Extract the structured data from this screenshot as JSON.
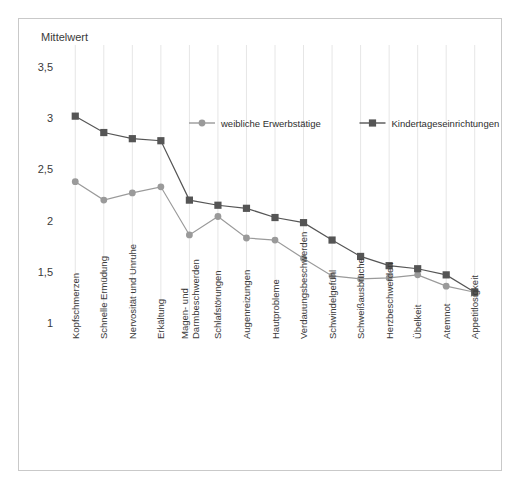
{
  "chart_data": {
    "type": "line",
    "title": "Mittelwert",
    "ylabel": "Mittelwert",
    "xlabel": "",
    "ylim": [
      1,
      3.5
    ],
    "yticks": [
      1,
      1.5,
      2,
      2.5,
      3,
      3.5
    ],
    "ytick_labels": [
      "1",
      "1,5",
      "2",
      "2,5",
      "3",
      "3,5"
    ],
    "grid": "vertical",
    "legend_position": "top-center",
    "categories": [
      "Kopfschmerzen",
      "Schnelle Ermüdung",
      "Nervosität und Unruhe",
      "Erkältung",
      "Magen- und Darmbeschwerden",
      "Schlafstörungen",
      "Augenreizungen",
      "Hautprobleme",
      "Verdauungsbeschwerden",
      "Schwindelgefühl",
      "Schweißausbrüche",
      "Herzbeschwerden",
      "Übelkeit",
      "Atemnot",
      "Appetitlosigkeit"
    ],
    "series": [
      {
        "name": "weibliche Erwerbstätige",
        "color": "#9a9a9a",
        "marker": "circle",
        "values": [
          2.38,
          2.2,
          2.27,
          2.33,
          1.86,
          2.04,
          1.83,
          1.81,
          1.63,
          1.46,
          1.43,
          1.44,
          1.47,
          1.36,
          1.3
        ]
      },
      {
        "name": "Kindertageseinrichtungen",
        "color": "#555555",
        "marker": "square",
        "values": [
          3.02,
          2.86,
          2.8,
          2.78,
          2.2,
          2.15,
          2.12,
          2.03,
          1.98,
          1.81,
          1.65,
          1.56,
          1.53,
          1.47,
          1.3
        ]
      }
    ]
  },
  "legend": {
    "entries": [
      {
        "label": "weibliche Erwerbstätige",
        "color": "#9a9a9a",
        "marker": "circle"
      },
      {
        "label": "Kindertageseinrichtungen",
        "color": "#555555",
        "marker": "square"
      }
    ]
  },
  "axis": {
    "y_title": "Mittelwert"
  },
  "colors": {
    "frame_border": "#c9c9c9",
    "gridline": "#e6e6e6",
    "text": "#3a3a3a",
    "series_light": "#9a9a9a",
    "series_dark": "#555555",
    "background": "#ffffff"
  }
}
